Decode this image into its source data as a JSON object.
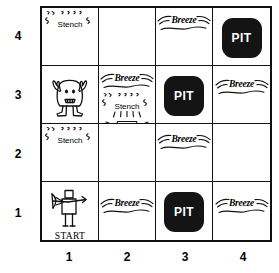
{
  "diagram": {
    "grid": {
      "rows": 4,
      "cols": 4,
      "row_labels": [
        "4",
        "3",
        "2",
        "1"
      ],
      "col_labels": [
        "1",
        "2",
        "3",
        "4"
      ]
    },
    "labels": {
      "stench": "Stench",
      "breeze": "Breeze",
      "pit": "PIT",
      "gold": "Gold",
      "start": "START"
    },
    "colors": {
      "pit_fill": "#141414",
      "pit_text": "#ffffff",
      "line": "#111111",
      "background": "#ffffff"
    },
    "cells": [
      {
        "col": 1,
        "row": 4,
        "contents": [
          "stench"
        ]
      },
      {
        "col": 2,
        "row": 4,
        "contents": []
      },
      {
        "col": 3,
        "row": 4,
        "contents": [
          "breeze"
        ]
      },
      {
        "col": 4,
        "row": 4,
        "contents": [
          "pit"
        ]
      },
      {
        "col": 1,
        "row": 3,
        "contents": [
          "wumpus"
        ]
      },
      {
        "col": 2,
        "row": 3,
        "contents": [
          "breeze",
          "stench",
          "gold"
        ]
      },
      {
        "col": 3,
        "row": 3,
        "contents": [
          "pit"
        ]
      },
      {
        "col": 4,
        "row": 3,
        "contents": [
          "breeze"
        ]
      },
      {
        "col": 1,
        "row": 2,
        "contents": [
          "stench"
        ]
      },
      {
        "col": 2,
        "row": 2,
        "contents": []
      },
      {
        "col": 3,
        "row": 2,
        "contents": [
          "breeze"
        ]
      },
      {
        "col": 4,
        "row": 2,
        "contents": []
      },
      {
        "col": 1,
        "row": 1,
        "contents": [
          "agent",
          "start"
        ]
      },
      {
        "col": 2,
        "row": 1,
        "contents": [
          "breeze"
        ]
      },
      {
        "col": 3,
        "row": 1,
        "contents": [
          "pit"
        ]
      },
      {
        "col": 4,
        "row": 1,
        "contents": [
          "breeze"
        ]
      }
    ]
  }
}
